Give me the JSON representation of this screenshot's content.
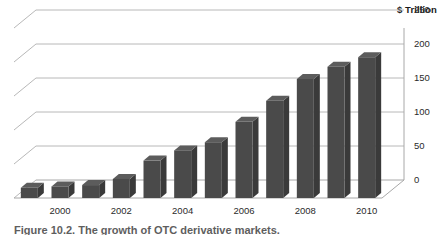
{
  "chart_data": {
    "type": "bar",
    "title": "",
    "subtitle": "",
    "xlabel": "",
    "ylabel": "$ Trillion",
    "ylim": [
      0,
      250
    ],
    "yticks": [
      0,
      50,
      100,
      150,
      200,
      250
    ],
    "grid": true,
    "legend": null,
    "three_d": true,
    "categories": [
      "1999",
      "2000",
      "2001",
      "2002",
      "2003",
      "2004",
      "2005",
      "2006",
      "2007",
      "2008",
      "2009",
      "2010"
    ],
    "xtick_labels": [
      "2000",
      "2002",
      "2004",
      "2006",
      "2008",
      "2010"
    ],
    "xtick_categories": [
      "2000",
      "2002",
      "2004",
      "2006",
      "2008",
      "2010"
    ],
    "values": [
      15,
      17,
      19,
      28,
      55,
      70,
      82,
      112,
      143,
      175,
      193,
      207
    ],
    "series": [
      {
        "name": "Notional amount outstanding",
        "values": [
          15,
          17,
          19,
          28,
          55,
          70,
          82,
          112,
          143,
          175,
          193,
          207
        ]
      }
    ],
    "bar_color": "#4a4a4a",
    "bar_side_color": "#3a3a3a",
    "bar_top_color": "#5c5c5c",
    "gridline_color": "#b8b8b8",
    "axis_color": "#a8a8a8"
  },
  "axis": {
    "y_title": "$ Trillion",
    "ticks": [
      "250",
      "200",
      "150",
      "100",
      "50",
      "0"
    ],
    "x_labels": [
      "2000",
      "2002",
      "2004",
      "2006",
      "2008",
      "2010"
    ]
  },
  "caption": {
    "text": "Figure 10.2. The growth of OTC derivative markets."
  }
}
